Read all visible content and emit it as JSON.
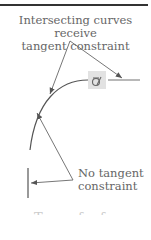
{
  "diagram": {
    "top_label": [
      "Intersecting curves receive",
      "tangent constraint"
    ],
    "bottom_label": [
      "No tangent",
      "constraint"
    ],
    "constraint_symbol": "tangent-constraint-icon",
    "colors": {
      "line": "#555555",
      "text": "#666666",
      "symbol_bg": "#e2e2e2"
    }
  },
  "caption_partial": "cut off"
}
